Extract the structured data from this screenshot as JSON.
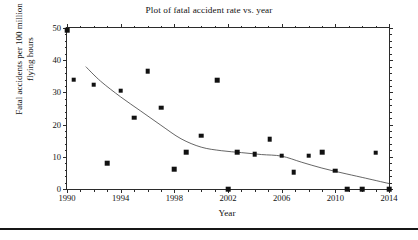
{
  "chart_data": {
    "type": "scatter",
    "title": "Plot of fatal accident rate vs. year",
    "xlabel": "Year",
    "ylabel": "Fatal accidents per 100 million flying hours",
    "ylabel_lines": [
      "Fatal accidents per 100 million",
      "flying hours"
    ],
    "xlim": [
      1990,
      2014
    ],
    "ylim": [
      0,
      50
    ],
    "xticks": [
      1990,
      1994,
      1998,
      2002,
      2006,
      2010,
      2014
    ],
    "xtick_labels": [
      "1990",
      "1994",
      "1998",
      "2002",
      "2006",
      "2010",
      "2014"
    ],
    "yticks": [
      0,
      10,
      20,
      30,
      40,
      50
    ],
    "ytick_labels": [
      "0",
      "10",
      "20",
      "30",
      "40",
      "50"
    ],
    "x_minor_step": 1,
    "y_minor_step": 2,
    "grid": false,
    "legend": "none",
    "marker": "square",
    "marker_color": "#111111",
    "line_color": "#555555",
    "series": [
      {
        "name": "Fatal accident rate",
        "points": [
          {
            "x": 1990.0,
            "y": 49.3
          },
          {
            "x": 1990.5,
            "y": 34.0
          },
          {
            "x": 1992.0,
            "y": 32.4
          },
          {
            "x": 1993.0,
            "y": 8.0
          },
          {
            "x": 1994.0,
            "y": 30.5
          },
          {
            "x": 1995.0,
            "y": 22.2
          },
          {
            "x": 1996.0,
            "y": 36.5
          },
          {
            "x": 1997.0,
            "y": 25.3
          },
          {
            "x": 1998.0,
            "y": 6.1
          },
          {
            "x": 1998.9,
            "y": 11.4
          },
          {
            "x": 2000.0,
            "y": 16.5
          },
          {
            "x": 2001.2,
            "y": 33.7
          },
          {
            "x": 2002.0,
            "y": 0.0
          },
          {
            "x": 2002.7,
            "y": 11.5
          },
          {
            "x": 2004.0,
            "y": 10.8
          },
          {
            "x": 2005.1,
            "y": 15.5
          },
          {
            "x": 2006.0,
            "y": 10.4
          },
          {
            "x": 2006.9,
            "y": 5.2
          },
          {
            "x": 2008.0,
            "y": 10.4
          },
          {
            "x": 2009.0,
            "y": 11.4
          },
          {
            "x": 2010.0,
            "y": 5.7
          },
          {
            "x": 2010.9,
            "y": 0.0
          },
          {
            "x": 2012.0,
            "y": 0.0
          },
          {
            "x": 2013.0,
            "y": 11.3
          },
          {
            "x": 2014.0,
            "y": 0.0
          }
        ]
      }
    ],
    "trend_line": {
      "name": "Smoothed trend",
      "points": [
        {
          "x": 1991.4,
          "y": 38.0
        },
        {
          "x": 1992.5,
          "y": 33.5
        },
        {
          "x": 1994.0,
          "y": 28.6
        },
        {
          "x": 1995.5,
          "y": 24.2
        },
        {
          "x": 1997.0,
          "y": 19.8
        },
        {
          "x": 1998.5,
          "y": 15.6
        },
        {
          "x": 2000.0,
          "y": 13.0
        },
        {
          "x": 2001.5,
          "y": 11.9
        },
        {
          "x": 2003.0,
          "y": 11.3
        },
        {
          "x": 2004.5,
          "y": 10.7
        },
        {
          "x": 2006.0,
          "y": 10.2
        },
        {
          "x": 2007.5,
          "y": 8.3
        },
        {
          "x": 2009.0,
          "y": 6.5
        },
        {
          "x": 2010.5,
          "y": 5.0
        },
        {
          "x": 2012.0,
          "y": 3.6
        },
        {
          "x": 2014.0,
          "y": 1.7
        }
      ]
    }
  }
}
